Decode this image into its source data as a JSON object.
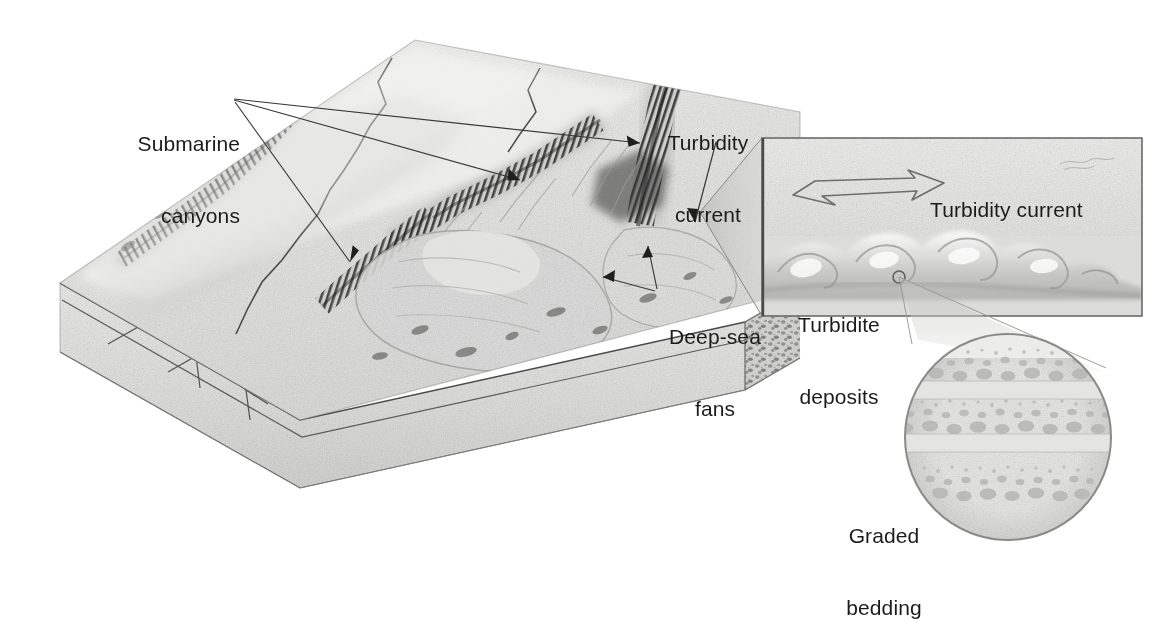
{
  "figure": {
    "type": "geologic-block-diagram",
    "background_color": "#ffffff",
    "text_color": "#1c1c1c",
    "line_color": "#4a4a4a"
  },
  "labels": {
    "submarine_canyons": "Submarine\ncanyons",
    "submarine_canyons_line1": "Submarine",
    "submarine_canyons_line2": "canyons",
    "turbidity_current_main": "Turbidity\ncurrent",
    "turbidity_current_main_line1": "Turbidity",
    "turbidity_current_main_line2": "current",
    "deep_sea_fans": "Deep-sea\nfans",
    "deep_sea_fans_line1": "Deep-sea",
    "deep_sea_fans_line2": "fans",
    "turbidity_current_inset": "Turbidity current",
    "turbidite_deposits": "Turbidite\ndeposits",
    "turbidite_deposits_line1": "Turbidite",
    "turbidite_deposits_line2": "deposits",
    "graded_bedding": "Graded\nbedding",
    "graded_bedding_line1": "Graded",
    "graded_bedding_line2": "bedding"
  },
  "block_diagram": {
    "name": "continental-margin-block",
    "top_surface_color": "#e9e9e7",
    "front_face_color": "#e2e2e0",
    "right_face_color": "#c8c8c6",
    "features": [
      "continental shelf",
      "continental slope",
      "submarine canyons",
      "deep-sea fans",
      "abyssal plain",
      "faulted strata"
    ]
  },
  "inset_panel": {
    "name": "turbidity-current-inset",
    "background_color": "#e6e6e4",
    "border_color": "#6b6b6b",
    "arrow": {
      "name": "flow-direction-arrow",
      "direction": "right",
      "style": "outline"
    },
    "marker": {
      "name": "zoom-origin-circle",
      "shape": "circle-outline"
    }
  },
  "graded_bedding_inset": {
    "name": "graded-bedding-circle",
    "shape": "circle",
    "beds": 3,
    "description": "Three fining-upward turbidite beds: coarse gravel at base grading to fine silt at top",
    "fill_color": "#e4e4e2",
    "border_color": "#8a8a8a"
  }
}
